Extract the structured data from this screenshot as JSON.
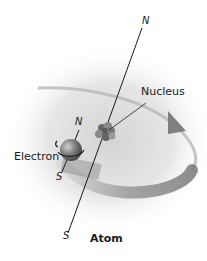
{
  "diagram": {
    "title": "Atom",
    "labels": {
      "nucleus": "Nucleus",
      "electron": "Electron",
      "nucleus_north": "N",
      "nucleus_south": "S",
      "electron_north": "N",
      "electron_south": "S"
    },
    "colors": {
      "background": "#ffffff",
      "glow": "#d9d9d9",
      "orbit": "#8c8c8c",
      "axis": "#1a1a1a",
      "electron": "#7a7a7a",
      "nucleus": "#6e6e6e"
    }
  }
}
